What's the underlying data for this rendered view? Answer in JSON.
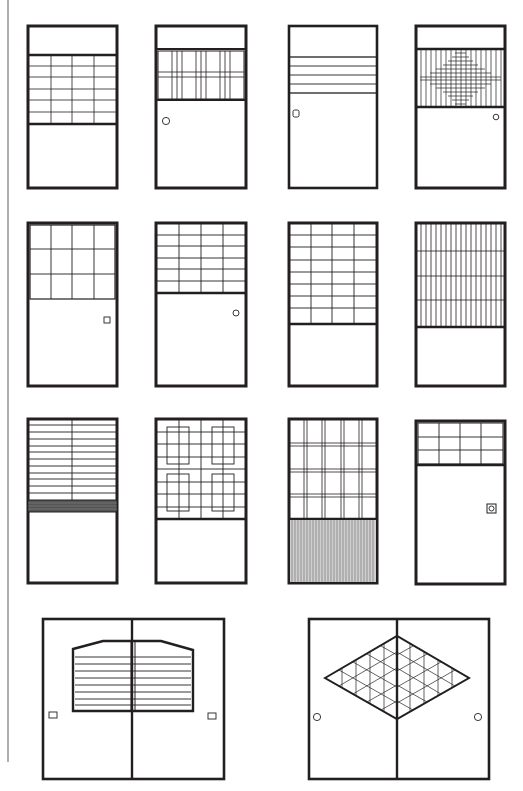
{
  "figure": {
    "width": 523,
    "height": 791,
    "line_color": "#231f20",
    "margin_rule": {
      "x": 8,
      "y1": 0,
      "y2": 762,
      "color": "#8a8a8a"
    }
  },
  "doors": [
    {
      "id": "d1",
      "row": 1,
      "col": 1,
      "x": 27,
      "y": 25,
      "w": 90,
      "h": 163,
      "pattern": "transom-top + grid 4x6 panel, plain bottom",
      "panel": {
        "y1": 55,
        "y2": 124,
        "cols": 4,
        "rows": 6
      },
      "handle": null
    },
    {
      "id": "d2",
      "row": 1,
      "col": 2,
      "x": 155,
      "y": 25,
      "w": 91,
      "h": 163,
      "pattern": "top transom + triple vertical clusters panel",
      "panel": {
        "y1": 50,
        "y2": 99
      },
      "handle": {
        "type": "circle",
        "x": 166,
        "y": 121
      }
    },
    {
      "id": "d3",
      "row": 1,
      "col": 3,
      "x": 288,
      "y": 25,
      "w": 89,
      "h": 163,
      "pattern": "narrow horizontal band of 4 rails",
      "panel": {
        "y1": 57,
        "y2": 93,
        "rows": 4
      },
      "handle": {
        "type": "rounded-square",
        "x": 296,
        "y": 114
      }
    },
    {
      "id": "d4",
      "row": 1,
      "col": 4,
      "x": 415,
      "y": 25,
      "w": 90,
      "h": 163,
      "pattern": "vertical ribs with diamond cross-grid",
      "panel": {
        "y1": 49,
        "y2": 107
      },
      "handle": {
        "type": "circle",
        "x": 496,
        "y": 117
      }
    },
    {
      "id": "d5",
      "row": 2,
      "col": 1,
      "x": 27,
      "y": 222,
      "w": 90,
      "h": 164,
      "pattern": "grid 4x3 inset panel",
      "panel": {
        "y1": 222,
        "y2": 299,
        "cols": 4,
        "rows": 3
      },
      "handle": {
        "type": "square",
        "x": 107,
        "y": 321
      }
    },
    {
      "id": "d6",
      "row": 2,
      "col": 2,
      "x": 155,
      "y": 222,
      "w": 91,
      "h": 164,
      "pattern": "grid 4x6 top panel",
      "panel": {
        "y1": 222,
        "y2": 293,
        "cols": 4,
        "rows": 6
      },
      "handle": {
        "type": "circle",
        "x": 236,
        "y": 313
      }
    },
    {
      "id": "d7",
      "row": 2,
      "col": 3,
      "x": 288,
      "y": 222,
      "w": 89,
      "h": 164,
      "pattern": "grid 4x8 tall panel",
      "panel": {
        "y1": 222,
        "y2": 324,
        "cols": 4,
        "rows": 8
      },
      "handle": null
    },
    {
      "id": "d8",
      "row": 2,
      "col": 4,
      "x": 415,
      "y": 222,
      "w": 90,
      "h": 164,
      "pattern": "dense vertical ribs with 4 horizontal rails",
      "panel": {
        "y1": 222,
        "y2": 327
      },
      "handle": null
    },
    {
      "id": "d9",
      "row": 3,
      "col": 1,
      "x": 27,
      "y": 418,
      "w": 90,
      "h": 165,
      "pattern": "horizontal rails with central vertical, dark band",
      "panel": {
        "y1": 418,
        "y2": 500,
        "rows": 11
      },
      "handle": null
    },
    {
      "id": "d10",
      "row": 3,
      "col": 2,
      "x": 155,
      "y": 418,
      "w": 91,
      "h": 165,
      "pattern": "grid with four inset rectangles",
      "panel": {
        "y1": 418,
        "y2": 519
      },
      "handle": null
    },
    {
      "id": "d11",
      "row": 3,
      "col": 3,
      "x": 288,
      "y": 418,
      "w": 89,
      "h": 165,
      "pattern": "double-line plaid grid over fine vertical-ribbed lower panel",
      "panel": {
        "y1": 418,
        "y2": 519
      },
      "handle": null
    },
    {
      "id": "d12",
      "row": 3,
      "col": 4,
      "x": 415,
      "y": 418,
      "w": 90,
      "h": 165,
      "pattern": "small 4x3 transom grid",
      "panel": {
        "y1": 418,
        "y2": 465,
        "cols": 4,
        "rows": 3
      },
      "handle": {
        "type": "square-ring",
        "x": 492,
        "y": 509
      }
    },
    {
      "id": "d13",
      "row": 4,
      "col": 1,
      "x": 42,
      "y": 618,
      "w": 182,
      "h": 161,
      "pattern": "pair of fusuma with hexagonal louvered window",
      "handles": [
        {
          "type": "rect",
          "x": 53,
          "y": 714
        },
        {
          "type": "rect",
          "x": 211,
          "y": 715
        }
      ]
    },
    {
      "id": "d14",
      "row": 4,
      "col": 2,
      "x": 308,
      "y": 618,
      "w": 181,
      "h": 161,
      "pattern": "pair of fusuma with diamond triangular lattice",
      "handles": [
        {
          "type": "circle",
          "x": 317,
          "y": 717
        },
        {
          "type": "circle",
          "x": 478,
          "y": 717
        }
      ]
    }
  ]
}
